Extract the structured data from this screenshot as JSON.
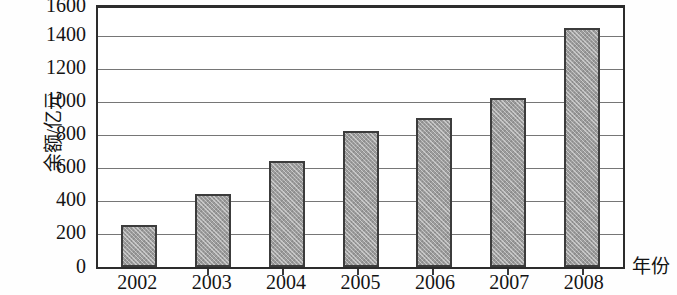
{
  "chart_data": {
    "type": "bar",
    "title": "",
    "xlabel": "年份",
    "ylabel": "余额/亿元",
    "categories": [
      "2002",
      "2003",
      "2004",
      "2005",
      "2006",
      "2007",
      "2008"
    ],
    "values": [
      260,
      450,
      650,
      840,
      920,
      1040,
      1470
    ],
    "ylim": [
      0,
      1600
    ],
    "ytick_step": 200,
    "yticks": [
      "0",
      "200",
      "400",
      "600",
      "800",
      "1000",
      "1200",
      "1400",
      "1600"
    ],
    "grid": "horizontal",
    "legend": "none",
    "series": [
      {
        "name": "余额/亿元",
        "values": [
          260,
          450,
          650,
          840,
          920,
          1040,
          1470
        ]
      }
    ],
    "bar_fill_color": "#9c9c9c",
    "bar_edge_color": "#3c3c3c",
    "axis_color": "#2c2c2c",
    "grid_color": "#767676"
  }
}
